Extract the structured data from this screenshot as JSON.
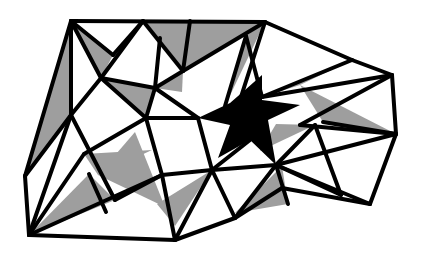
{
  "diagram": {
    "title": "",
    "colors": {
      "background": "#ffffff",
      "shaded": "#9e9e9e",
      "star": "#000000",
      "edge": "#000000"
    },
    "shaded_triangles": [
      [
        [
          71,
          21
        ],
        [
          25,
          176
        ],
        [
          71,
          115
        ]
      ],
      [
        [
          71,
          21
        ],
        [
          101,
          78
        ],
        [
          113,
          55
        ]
      ],
      [
        [
          143,
          21
        ],
        [
          190,
          21
        ],
        [
          183,
          71
        ]
      ],
      [
        [
          190,
          21
        ],
        [
          265,
          22
        ],
        [
          183,
          71
        ]
      ],
      [
        [
          183,
          71
        ],
        [
          155,
          88
        ],
        [
          182,
          92
        ]
      ],
      [
        [
          101,
          78
        ],
        [
          155,
          88
        ],
        [
          146,
          118
        ]
      ],
      [
        [
          246,
          36
        ],
        [
          225,
          106
        ],
        [
          265,
          22
        ]
      ],
      [
        [
          262,
          97
        ],
        [
          352,
          60
        ],
        [
          300,
          85
        ]
      ],
      [
        [
          300,
          85
        ],
        [
          323,
          122
        ],
        [
          396,
          134
        ]
      ],
      [
        [
          84,
          154
        ],
        [
          152,
          150
        ],
        [
          98,
          175
        ]
      ],
      [
        [
          98,
          175
        ],
        [
          165,
          207
        ],
        [
          135,
          132
        ]
      ],
      [
        [
          29,
          235
        ],
        [
          89,
          174
        ],
        [
          115,
          200
        ]
      ],
      [
        [
          175,
          226
        ],
        [
          157,
          204
        ],
        [
          212,
          170
        ]
      ],
      [
        [
          235,
          213
        ],
        [
          282,
          166
        ],
        [
          288,
          204
        ]
      ],
      [
        [
          276,
          124
        ],
        [
          315,
          125
        ],
        [
          260,
          151
        ]
      ]
    ],
    "star": [
      [
        230,
        103
      ],
      [
        245,
        90
      ],
      [
        262,
        75
      ],
      [
        262,
        100
      ],
      [
        300,
        105
      ],
      [
        268,
        120
      ],
      [
        276,
        165
      ],
      [
        250,
        140
      ],
      [
        218,
        158
      ],
      [
        230,
        125
      ],
      [
        198,
        118
      ]
    ],
    "edges": [
      [
        [
          71,
          21
        ],
        [
          265,
          22
        ]
      ],
      [
        [
          265,
          22
        ],
        [
          352,
          60
        ]
      ],
      [
        [
          352,
          60
        ],
        [
          392,
          75
        ]
      ],
      [
        [
          392,
          75
        ],
        [
          396,
          134
        ]
      ],
      [
        [
          396,
          134
        ],
        [
          370,
          204
        ]
      ],
      [
        [
          370,
          204
        ],
        [
          282,
          188
        ]
      ],
      [
        [
          282,
          188
        ],
        [
          235,
          218
        ]
      ],
      [
        [
          235,
          218
        ],
        [
          175,
          240
        ]
      ],
      [
        [
          175,
          240
        ],
        [
          29,
          235
        ]
      ],
      [
        [
          29,
          235
        ],
        [
          25,
          176
        ]
      ],
      [
        [
          25,
          176
        ],
        [
          71,
          21
        ]
      ],
      [
        [
          71,
          21
        ],
        [
          71,
          115
        ]
      ],
      [
        [
          71,
          115
        ],
        [
          25,
          176
        ]
      ],
      [
        [
          71,
          21
        ],
        [
          113,
          55
        ]
      ],
      [
        [
          113,
          55
        ],
        [
          143,
          21
        ]
      ],
      [
        [
          71,
          21
        ],
        [
          101,
          78
        ]
      ],
      [
        [
          101,
          78
        ],
        [
          155,
          88
        ]
      ],
      [
        [
          143,
          21
        ],
        [
          101,
          78
        ]
      ],
      [
        [
          143,
          21
        ],
        [
          183,
          71
        ]
      ],
      [
        [
          183,
          71
        ],
        [
          190,
          21
        ]
      ],
      [
        [
          183,
          71
        ],
        [
          265,
          22
        ]
      ],
      [
        [
          155,
          88
        ],
        [
          160,
          38
        ]
      ],
      [
        [
          155,
          88
        ],
        [
          183,
          71
        ]
      ],
      [
        [
          101,
          78
        ],
        [
          71,
          115
        ]
      ],
      [
        [
          101,
          78
        ],
        [
          146,
          118
        ]
      ],
      [
        [
          155,
          88
        ],
        [
          146,
          118
        ]
      ],
      [
        [
          71,
          115
        ],
        [
          29,
          235
        ]
      ],
      [
        [
          71,
          115
        ],
        [
          115,
          200
        ]
      ],
      [
        [
          146,
          118
        ],
        [
          162,
          175
        ]
      ],
      [
        [
          146,
          118
        ],
        [
          198,
          118
        ]
      ],
      [
        [
          155,
          88
        ],
        [
          198,
          118
        ]
      ],
      [
        [
          29,
          235
        ],
        [
          162,
          175
        ]
      ],
      [
        [
          89,
          174
        ],
        [
          106,
          212
        ]
      ],
      [
        [
          162,
          175
        ],
        [
          175,
          240
        ]
      ],
      [
        [
          162,
          175
        ],
        [
          212,
          170
        ]
      ],
      [
        [
          212,
          170
        ],
        [
          175,
          240
        ]
      ],
      [
        [
          198,
          118
        ],
        [
          212,
          170
        ]
      ],
      [
        [
          212,
          170
        ],
        [
          235,
          218
        ]
      ],
      [
        [
          212,
          170
        ],
        [
          276,
          165
        ]
      ],
      [
        [
          246,
          36
        ],
        [
          225,
          106
        ]
      ],
      [
        [
          246,
          36
        ],
        [
          262,
          97
        ]
      ],
      [
        [
          265,
          22
        ],
        [
          240,
          100
        ]
      ],
      [
        [
          262,
          97
        ],
        [
          352,
          60
        ]
      ],
      [
        [
          262,
          97
        ],
        [
          392,
          75
        ]
      ],
      [
        [
          392,
          75
        ],
        [
          300,
          125
        ]
      ],
      [
        [
          323,
          122
        ],
        [
          396,
          134
        ]
      ],
      [
        [
          300,
          125
        ],
        [
          396,
          134
        ]
      ],
      [
        [
          276,
          165
        ],
        [
          396,
          134
        ]
      ],
      [
        [
          276,
          165
        ],
        [
          370,
          204
        ]
      ],
      [
        [
          276,
          165
        ],
        [
          315,
          125
        ]
      ],
      [
        [
          315,
          125
        ],
        [
          341,
          195
        ]
      ],
      [
        [
          276,
          165
        ],
        [
          341,
          195
        ]
      ],
      [
        [
          276,
          165
        ],
        [
          288,
          204
        ]
      ],
      [
        [
          276,
          165
        ],
        [
          235,
          218
        ]
      ],
      [
        [
          212,
          170
        ],
        [
          250,
          140
        ]
      ],
      [
        [
          146,
          118
        ],
        [
          84,
          154
        ]
      ],
      [
        [
          84,
          154
        ],
        [
          29,
          235
        ]
      ],
      [
        [
          115,
          200
        ],
        [
          162,
          175
        ]
      ]
    ]
  }
}
